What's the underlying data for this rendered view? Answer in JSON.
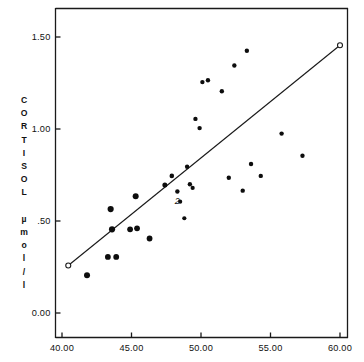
{
  "chart_data": {
    "type": "scatter",
    "title": "",
    "xlabel": "",
    "ylabel": "CORTISOL µmol/l",
    "ylabel_lines": [
      "C",
      "O",
      "R",
      "T",
      "I",
      "S",
      "O",
      "L",
      "",
      "µ",
      "m",
      "o",
      "l",
      "/",
      "l"
    ],
    "xlim": [
      40.0,
      60.0
    ],
    "ylim": [
      0.0,
      1.55
    ],
    "xticks": [
      40.0,
      45.0,
      50.0,
      55.0,
      60.0
    ],
    "xtick_labels": [
      "40.00",
      "45.00",
      "50.00",
      "55.00",
      "60.00"
    ],
    "yticks": [
      0.0,
      0.5,
      1.0,
      1.5
    ],
    "ytick_labels": [
      "0.00",
      ".50",
      "1.00",
      "1.50"
    ],
    "grid": false,
    "legend": null,
    "marker_color": "#0d0d0d",
    "line_color": "#1a1a1a",
    "points": [
      {
        "x": 41.8,
        "y": 0.205,
        "r": 3.0
      },
      {
        "x": 43.3,
        "y": 0.305,
        "r": 2.9
      },
      {
        "x": 43.9,
        "y": 0.305,
        "r": 2.9
      },
      {
        "x": 43.6,
        "y": 0.455,
        "r": 3.1
      },
      {
        "x": 43.5,
        "y": 0.565,
        "r": 3.1
      },
      {
        "x": 44.9,
        "y": 0.455,
        "r": 2.9
      },
      {
        "x": 45.4,
        "y": 0.46,
        "r": 2.9
      },
      {
        "x": 45.3,
        "y": 0.635,
        "r": 3.0
      },
      {
        "x": 46.3,
        "y": 0.405,
        "r": 2.9
      },
      {
        "x": 47.4,
        "y": 0.695,
        "r": 2.5
      },
      {
        "x": 47.9,
        "y": 0.745,
        "r": 2.3
      },
      {
        "x": 48.3,
        "y": 0.66,
        "r": 2.2
      },
      {
        "x": 48.5,
        "y": 0.605,
        "r": 2.1
      },
      {
        "x": 49.0,
        "y": 0.795,
        "r": 2.2
      },
      {
        "x": 49.2,
        "y": 0.7,
        "r": 2.2
      },
      {
        "x": 48.8,
        "y": 0.515,
        "r": 2.1
      },
      {
        "x": 49.4,
        "y": 0.68,
        "r": 2.1
      },
      {
        "x": 49.6,
        "y": 1.055,
        "r": 2.2
      },
      {
        "x": 49.9,
        "y": 1.005,
        "r": 2.2
      },
      {
        "x": 50.1,
        "y": 1.255,
        "r": 2.2
      },
      {
        "x": 50.5,
        "y": 1.265,
        "r": 2.2
      },
      {
        "x": 51.5,
        "y": 1.205,
        "r": 2.2
      },
      {
        "x": 52.0,
        "y": 0.735,
        "r": 2.2
      },
      {
        "x": 52.4,
        "y": 1.345,
        "r": 2.2
      },
      {
        "x": 53.0,
        "y": 0.665,
        "r": 2.2
      },
      {
        "x": 53.3,
        "y": 1.425,
        "r": 2.2
      },
      {
        "x": 53.6,
        "y": 0.81,
        "r": 2.2
      },
      {
        "x": 54.3,
        "y": 0.745,
        "r": 2.2
      },
      {
        "x": 55.8,
        "y": 0.975,
        "r": 2.2
      },
      {
        "x": 57.3,
        "y": 0.855,
        "r": 2.2
      }
    ],
    "overlap_annotations": [
      {
        "x": 48.3,
        "y": 0.595,
        "label": "2"
      }
    ],
    "fit_line": {
      "x1": 40.45,
      "y1": 0.258,
      "x2": 60.0,
      "y2": 1.455,
      "endpoint_marker": "open-circle"
    }
  }
}
